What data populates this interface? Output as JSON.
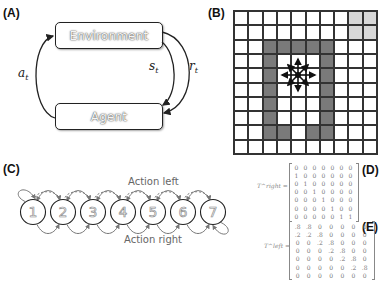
{
  "panels": {
    "a": {
      "label": "(A)",
      "environment": "Environment",
      "agent": "Agent",
      "action_symbol": "a",
      "action_sub": "t",
      "state_symbol": "s",
      "state_sub": "t",
      "reward_symbol": "r",
      "reward_sub": "t"
    },
    "b": {
      "label": "(B)",
      "grid_size": 10,
      "wall_cells": [
        [
          2,
          2
        ],
        [
          2,
          3
        ],
        [
          2,
          4
        ],
        [
          2,
          5
        ],
        [
          2,
          6
        ],
        [
          3,
          2
        ],
        [
          3,
          6
        ],
        [
          4,
          2
        ],
        [
          4,
          6
        ],
        [
          5,
          2
        ],
        [
          5,
          6
        ],
        [
          6,
          2
        ],
        [
          6,
          6
        ],
        [
          7,
          2
        ],
        [
          7,
          6
        ],
        [
          8,
          2
        ],
        [
          8,
          3
        ],
        [
          8,
          5
        ],
        [
          8,
          6
        ]
      ],
      "goal_cells": [
        [
          0,
          8
        ],
        [
          0,
          9
        ],
        [
          1,
          8
        ],
        [
          1,
          9
        ]
      ],
      "agent_cell": [
        4,
        4
      ],
      "agent_icon": "eight-direction-arrows"
    },
    "c": {
      "label": "(C)",
      "top_caption": "Action left",
      "bottom_caption": "Action right",
      "states": [
        "1",
        "2",
        "3",
        "4",
        "5",
        "6",
        "7"
      ]
    },
    "d": {
      "label": "(D)",
      "matrix_label": "T^right =",
      "matrix": [
        [
          "0",
          "0",
          "0",
          "0",
          "0",
          "0",
          "0"
        ],
        [
          "1",
          "0",
          "0",
          "0",
          "0",
          "0",
          "0"
        ],
        [
          "0",
          "1",
          "0",
          "0",
          "0",
          "0",
          "0"
        ],
        [
          "0",
          "0",
          "1",
          "0",
          "0",
          "0",
          "0"
        ],
        [
          "0",
          "0",
          "0",
          "1",
          "0",
          "0",
          "0"
        ],
        [
          "0",
          "0",
          "0",
          "0",
          "1",
          "0",
          "0"
        ],
        [
          "0",
          "0",
          "0",
          "0",
          "0",
          "1",
          "1"
        ]
      ]
    },
    "e": {
      "label": "(E)",
      "matrix_label": "T^left =",
      "matrix": [
        [
          ".8",
          ".8",
          "0",
          "0",
          "0",
          "0",
          "0"
        ],
        [
          ".2",
          ".2",
          ".8",
          "0",
          "0",
          "0",
          "0"
        ],
        [
          "0",
          "0",
          ".2",
          ".8",
          "0",
          "0",
          "0"
        ],
        [
          "0",
          "0",
          "0",
          ".2",
          ".8",
          "0",
          "0"
        ],
        [
          "0",
          "0",
          "0",
          "0",
          ".2",
          ".8",
          "0"
        ],
        [
          "0",
          "0",
          "0",
          "0",
          "0",
          ".2",
          ".8"
        ],
        [
          "0",
          "0",
          "0",
          "0",
          "0",
          "0",
          "0"
        ]
      ]
    }
  },
  "colors": {
    "wall": "#7a7a7a",
    "goal": "#d8d8d8",
    "arrow_gray": "#777777",
    "line": "#222222"
  }
}
